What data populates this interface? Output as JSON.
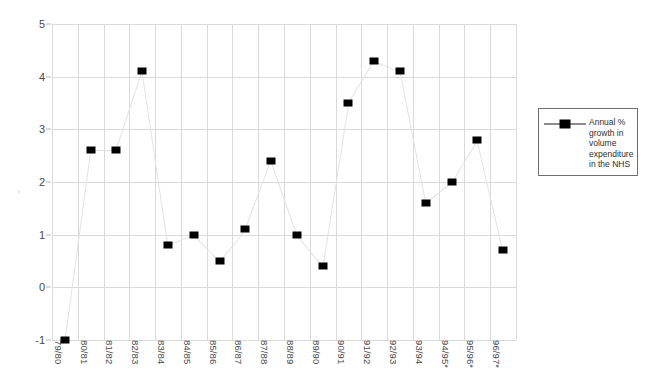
{
  "chart_data": {
    "type": "line",
    "title": "",
    "subtitle": "",
    "xlabel": "",
    "ylabel": "",
    "ylim": [
      -1,
      5
    ],
    "y_ticks": [
      5,
      4,
      3,
      2,
      1,
      0,
      -1
    ],
    "grid": true,
    "legend_position": "right",
    "categories": [
      "79/80",
      "80/81",
      "81/82",
      "82/83",
      "83/84",
      "84/85",
      "85/86",
      "86/87",
      "87/88",
      "88/89",
      "89/90",
      "90/91",
      "91/92",
      "92/93",
      "93/94",
      "94/95*",
      "95/96*",
      "96/97*"
    ],
    "series": [
      {
        "name": "Annual % growth in volume expenditure in the NHS",
        "marker": "square",
        "marker_color": "#000000",
        "line_color": "#e2e2e2",
        "values": [
          -1.0,
          2.6,
          2.6,
          4.1,
          0.8,
          1.0,
          0.5,
          1.1,
          2.4,
          1.0,
          0.4,
          3.5,
          4.3,
          4.1,
          1.6,
          2.0,
          2.8,
          0.7
        ]
      }
    ]
  },
  "legend": {
    "entries": [
      {
        "label": "Annual % growth in volume expenditure in the NHS"
      }
    ]
  },
  "axes": {
    "y_tick_labels": [
      "5",
      "4",
      "3",
      "2",
      "1",
      "0",
      "-1"
    ],
    "x_tick_labels": [
      "79/80",
      "80/81",
      "81/82",
      "82/83",
      "83/84",
      "84/85",
      "85/86",
      "86/87",
      "87/88",
      "88/89",
      "89/90",
      "90/91",
      "91/92",
      "92/93",
      "93/94",
      "94/95*",
      "95/96*",
      "96/97*"
    ]
  },
  "artifact": {
    "edge_mark": ","
  },
  "colors": {
    "marker": "#000000",
    "gridline": "#d9d9d9",
    "line": "#e2e2e2",
    "legend_border": "#6e6e6e",
    "text": "#4a4a4a",
    "background": "#ffffff"
  }
}
